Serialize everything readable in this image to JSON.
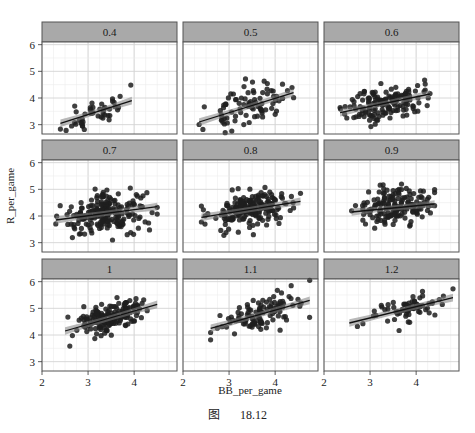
{
  "caption": {
    "label": "图",
    "number": "18.12"
  },
  "colors": {
    "strip_fill": "#a9a9a9",
    "panel_border": "#555555",
    "grid_major": "#d4d4d4",
    "grid_minor": "#ececec",
    "point": "#1e1e1e",
    "line": "#111111",
    "band": "#7f7f7f"
  },
  "chart_data": {
    "type": "scatter",
    "layout": "facet_wrap 3x3",
    "xlabel": "BB_per_game",
    "ylabel": "R_per_game",
    "xlim": [
      2,
      4.93
    ],
    "ylim": [
      2.65,
      6.1
    ],
    "x_ticks": [
      2,
      3,
      4
    ],
    "y_ticks": [
      3,
      4,
      5,
      6
    ],
    "grid": true,
    "smooth": "lm with confidence band",
    "facets": [
      {
        "label": "0.4",
        "fit": {
          "x0": 2.4,
          "x1": 3.95,
          "y0": 3.05,
          "y1": 3.9
        },
        "n": 45,
        "xr": [
          2.4,
          3.95
        ],
        "sd": 0.3,
        "seed": 11
      },
      {
        "label": "0.5",
        "fit": {
          "x0": 2.35,
          "x1": 4.4,
          "y0": 3.1,
          "y1": 4.2
        },
        "n": 85,
        "xr": [
          2.35,
          4.4
        ],
        "sd": 0.35,
        "seed": 23
      },
      {
        "label": "0.6",
        "fit": {
          "x0": 2.35,
          "x1": 4.3,
          "y0": 3.45,
          "y1": 4.15
        },
        "n": 150,
        "xr": [
          2.35,
          4.3
        ],
        "sd": 0.32,
        "seed": 37
      },
      {
        "label": "0.7",
        "fit": {
          "x0": 2.3,
          "x1": 4.5,
          "y0": 3.85,
          "y1": 4.35
        },
        "n": 210,
        "xr": [
          2.3,
          4.5
        ],
        "sd": 0.36,
        "seed": 41
      },
      {
        "label": "0.8",
        "fit": {
          "x0": 2.4,
          "x1": 4.55,
          "y0": 3.95,
          "y1": 4.55
        },
        "n": 200,
        "xr": [
          2.4,
          4.55
        ],
        "sd": 0.34,
        "seed": 53
      },
      {
        "label": "0.9",
        "fit": {
          "x0": 2.6,
          "x1": 4.4,
          "y0": 4.15,
          "y1": 4.45
        },
        "n": 160,
        "xr": [
          2.6,
          4.4
        ],
        "sd": 0.34,
        "seed": 67
      },
      {
        "label": "1",
        "fit": {
          "x0": 2.5,
          "x1": 4.5,
          "y0": 4.15,
          "y1": 5.15
        },
        "n": 170,
        "xr": [
          2.5,
          4.5
        ],
        "sd": 0.3,
        "seed": 71
      },
      {
        "label": "1.1",
        "fit": {
          "x0": 2.6,
          "x1": 4.75,
          "y0": 4.25,
          "y1": 5.3
        },
        "n": 110,
        "xr": [
          2.6,
          4.75
        ],
        "sd": 0.3,
        "seed": 83
      },
      {
        "label": "1.2",
        "fit": {
          "x0": 2.55,
          "x1": 4.8,
          "y0": 4.45,
          "y1": 5.4
        },
        "n": 70,
        "xr": [
          2.55,
          4.8
        ],
        "sd": 0.25,
        "seed": 97
      }
    ]
  }
}
